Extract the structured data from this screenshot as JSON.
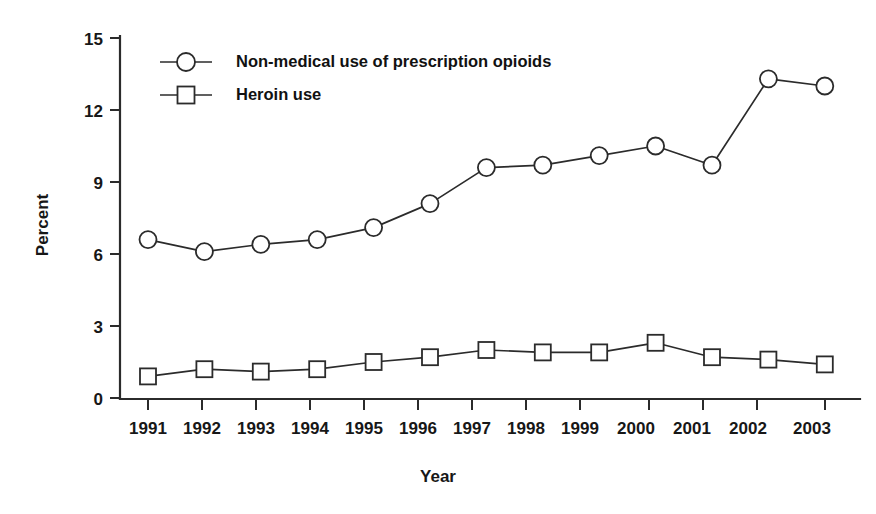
{
  "chart_data": {
    "type": "line",
    "title": "",
    "xlabel": "Year",
    "ylabel": "Percent",
    "categories": [
      "1991",
      "1992",
      "1993",
      "1994",
      "1995",
      "1996",
      "1997",
      "1998",
      "1999",
      "2000",
      "2001",
      "2002",
      "2003"
    ],
    "x": [
      1991,
      1992,
      1993,
      1994,
      1995,
      1996,
      1997,
      1998,
      1999,
      2000,
      2001,
      2002,
      2003
    ],
    "series": [
      {
        "name": "Non-medical use of prescription opioids",
        "marker": "circle",
        "values": [
          6.6,
          6.1,
          6.4,
          6.6,
          7.1,
          8.1,
          9.6,
          9.7,
          10.1,
          10.5,
          9.7,
          13.3,
          13.0
        ]
      },
      {
        "name": "Heroin use",
        "marker": "square",
        "values": [
          0.9,
          1.2,
          1.1,
          1.2,
          1.5,
          1.7,
          2.0,
          1.9,
          1.9,
          2.3,
          1.7,
          1.6,
          1.4
        ]
      }
    ],
    "ylim": [
      0,
      15
    ],
    "yticks": [
      0,
      3,
      6,
      9,
      12,
      15
    ],
    "ytick_labels": [
      "0",
      "3",
      "6",
      "9",
      "12",
      "15"
    ],
    "grid": false,
    "legend_position": "top-left-inside",
    "line_color": "#2b2b2b",
    "marker_fill": "#ffffff",
    "background": "#ffffff"
  },
  "legend": {
    "entries": [
      {
        "label": "Non-medical use of prescription opioids",
        "marker": "circle"
      },
      {
        "label": "Heroin use",
        "marker": "square"
      }
    ]
  },
  "axes": {
    "y_title": "Percent",
    "x_title": "Year"
  }
}
